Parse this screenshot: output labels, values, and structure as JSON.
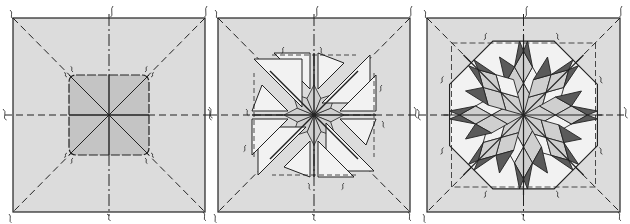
{
  "figure": {
    "colors": {
      "background": "#ffffff",
      "panel_fill": "#dcdcdc",
      "center_fill": "#c4c4c4",
      "light_fill": "#f2f2f2",
      "mid_fill": "#cfcfcf",
      "dark_fill": "#5a5a5a",
      "line": "#222222"
    },
    "panels": [
      {
        "step": 1,
        "label": "center-square-step"
      },
      {
        "step": 2,
        "label": "star-points-step"
      },
      {
        "step": 3,
        "label": "complete-star-step"
      }
    ]
  }
}
